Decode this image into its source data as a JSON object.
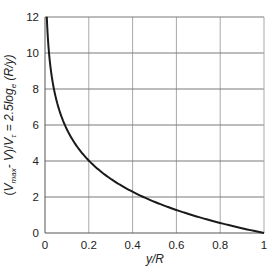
{
  "chart_data": {
    "type": "line",
    "title": "",
    "xlabel": "y/R",
    "ylabel": "(V_max - V)/V_τ = 2.5 log_e (R/y)",
    "ylabel_parts": {
      "open": "(",
      "v": "V",
      "max_sub": "max",
      "minus_v": "- V",
      "close_slash": ")/",
      "vt": "V",
      "tau_sub": "τ",
      "eq": " = 2.5",
      "log": "log",
      "e_sub": "e",
      "arg": " (R/y)"
    },
    "xlim": [
      0,
      1
    ],
    "ylim": [
      0,
      12
    ],
    "xticks": [
      "0",
      "0.2",
      "0.4",
      "0.6",
      "0.8",
      "1"
    ],
    "yticks": [
      "0",
      "2",
      "4",
      "6",
      "8",
      "10",
      "12"
    ],
    "grid": true,
    "legend": null,
    "series": [
      {
        "name": "2.5 ln(R/y)",
        "color": "#1a1a1a",
        "x": [
          0.0082,
          0.01,
          0.015,
          0.02,
          0.03,
          0.04,
          0.05,
          0.06,
          0.08,
          0.1,
          0.12,
          0.15,
          0.2,
          0.25,
          0.3,
          0.35,
          0.4,
          0.45,
          0.5,
          0.55,
          0.6,
          0.65,
          0.7,
          0.75,
          0.8,
          0.85,
          0.9,
          0.95,
          1.0
        ],
        "y": [
          12.0,
          11.51,
          10.5,
          9.78,
          8.77,
          8.05,
          7.49,
          7.03,
          6.31,
          5.76,
          5.3,
          4.74,
          4.02,
          3.47,
          3.01,
          2.62,
          2.29,
          2.0,
          1.73,
          1.49,
          1.28,
          1.08,
          0.89,
          0.72,
          0.56,
          0.41,
          0.26,
          0.13,
          0.0
        ]
      }
    ]
  },
  "colors": {
    "curve": "#1a1a1a",
    "hgrid": "#7a7a7a",
    "vgrid": "#a8a8a8",
    "axis": "#555555"
  }
}
